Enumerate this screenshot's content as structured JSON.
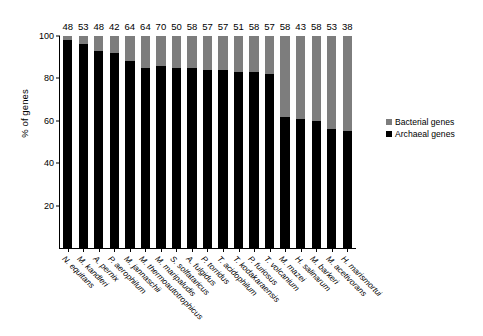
{
  "chart_data": {
    "type": "bar",
    "stacked": true,
    "title": "",
    "xlabel": "",
    "ylabel": "% of genes",
    "ylim": [
      0,
      100
    ],
    "yticks": [
      20,
      40,
      60,
      80,
      100
    ],
    "ytick_labels": [
      "20",
      "40",
      "60",
      "80",
      "100"
    ],
    "grid": false,
    "legend_position": "right",
    "categories": [
      "N. equitans",
      "M. kandleri",
      "A. pernix",
      "P. aerophilum",
      "M. jannaschii",
      "M. thermoautotrophicus",
      "M. maripaludis",
      "S. solfataricus",
      "A. fulgidus",
      "P. torridus",
      "T. acidophilum",
      "T. kodakaraensis",
      "P. furiosus",
      "T. volcanium",
      "M. mazei",
      "H. salinarum",
      "M. barkeri",
      "M. acetivorans",
      "H. marismortui"
    ],
    "series": [
      {
        "name": "Archaeal genes",
        "color": "#000000",
        "values": [
          98,
          96,
          93,
          92,
          88,
          85,
          86,
          85,
          85,
          84,
          84,
          83,
          83,
          82,
          62,
          61,
          60,
          56,
          55
        ]
      },
      {
        "name": "Bacterial genes",
        "color": "#7d7d7d",
        "values": [
          2,
          4,
          7,
          8,
          12,
          15,
          14,
          15,
          15,
          16,
          16,
          17,
          17,
          18,
          38,
          39,
          40,
          44,
          45
        ]
      }
    ],
    "bar_top_labels": [
      48,
      53,
      48,
      42,
      64,
      64,
      70,
      50,
      58,
      57,
      57,
      51,
      58,
      57,
      58,
      43,
      58,
      53,
      38
    ],
    "legend": [
      {
        "label": "Bacterial genes",
        "color": "#7d7d7d"
      },
      {
        "label": "Archaeal genes",
        "color": "#000000"
      }
    ]
  }
}
